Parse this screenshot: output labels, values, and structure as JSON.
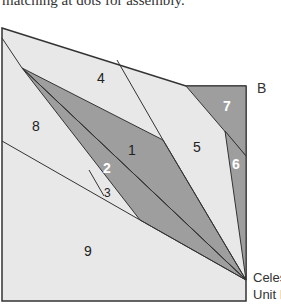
{
  "caption": "matching at dots for assembly.",
  "corner_label": "B",
  "unit_label": {
    "line1": "Celes",
    "line2": "Unit I"
  },
  "pieces": [
    {
      "id": "1",
      "shade": "dark"
    },
    {
      "id": "2",
      "shade": "dark"
    },
    {
      "id": "3",
      "shade": "light"
    },
    {
      "id": "4",
      "shade": "light"
    },
    {
      "id": "5",
      "shade": "light"
    },
    {
      "id": "6",
      "shade": "dark"
    },
    {
      "id": "7",
      "shade": "dark"
    },
    {
      "id": "8",
      "shade": "light"
    },
    {
      "id": "9",
      "shade": "light"
    }
  ],
  "colors": {
    "light": "#e8e8e8",
    "dark": "#9e9e9e",
    "line": "#333333"
  }
}
